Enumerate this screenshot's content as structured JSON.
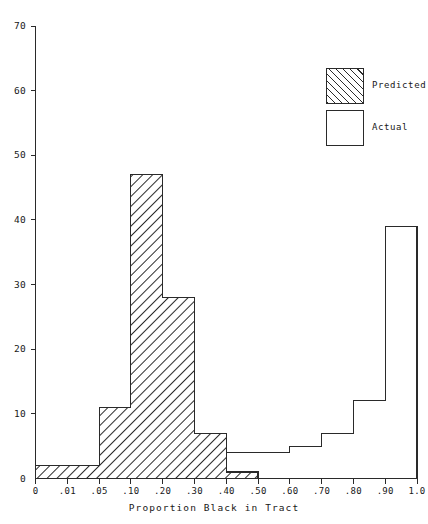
{
  "chart_data": {
    "type": "bar",
    "title": "",
    "xlabel": "Proportion Black in Tract",
    "ylabel": "",
    "grid": false,
    "legend_position": "top-right",
    "ylim": [
      0,
      70
    ],
    "ytick_labels": [
      "0",
      "10",
      "20",
      "30",
      "40",
      "50",
      "60",
      "70"
    ],
    "ytick_values": [
      0,
      10,
      20,
      30,
      40,
      50,
      60,
      70
    ],
    "xtick_labels": [
      "0",
      ".01",
      ".05",
      ".10",
      ".20",
      ".30",
      ".40",
      ".50",
      ".60",
      ".70",
      ".80",
      ".90",
      "1.0"
    ],
    "bin_edges": [
      0,
      0.01,
      0.05,
      0.1,
      0.2,
      0.3,
      0.4,
      0.5,
      0.6,
      0.7,
      0.8,
      0.9,
      1.0
    ],
    "categories": [
      "0-.01",
      ".01-.05",
      ".05-.10",
      ".10-.20",
      ".20-.30",
      ".30-.40",
      ".40-.50",
      ".50-.60",
      ".60-.70",
      ".70-.80",
      ".80-.90",
      ".90-1.0"
    ],
    "series": [
      {
        "name": "Predicted",
        "style": "hatched",
        "values": [
          2,
          2,
          11,
          47,
          28,
          7,
          1,
          0,
          0,
          0,
          0,
          0
        ]
      },
      {
        "name": "Actual",
        "style": "open",
        "values": [
          1,
          1,
          2,
          3,
          4,
          4,
          4,
          4,
          5,
          7,
          12,
          39
        ]
      }
    ]
  },
  "legend": {
    "items": [
      {
        "label": "Predicted",
        "style": "hatched"
      },
      {
        "label": "Actual",
        "style": "open"
      }
    ]
  },
  "axes": {
    "x_title": "Proportion Black in Tract"
  }
}
